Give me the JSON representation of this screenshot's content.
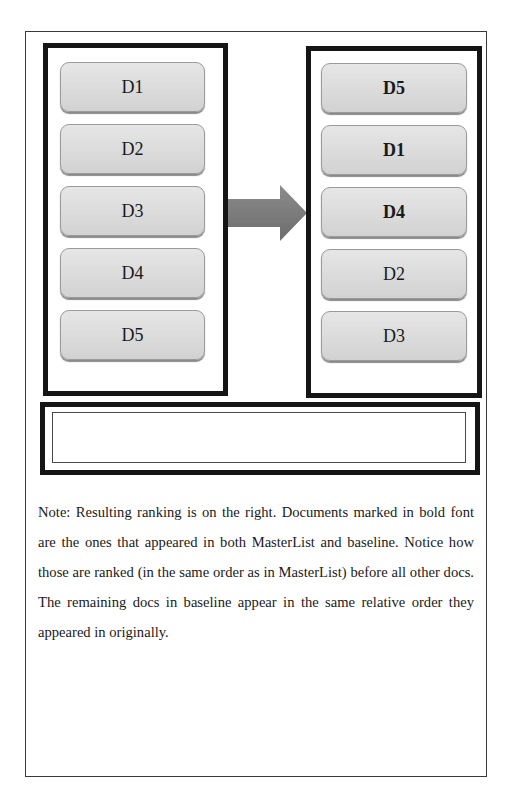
{
  "left_list": {
    "label": "baseline",
    "items": [
      {
        "label": "D1",
        "bold": false
      },
      {
        "label": "D2",
        "bold": false
      },
      {
        "label": "D3",
        "bold": false
      },
      {
        "label": "D4",
        "bold": false
      },
      {
        "label": "D5",
        "bold": false
      }
    ]
  },
  "right_list": {
    "label": "resulting ranking",
    "items": [
      {
        "label": "D5",
        "bold": true
      },
      {
        "label": "D1",
        "bold": true
      },
      {
        "label": "D4",
        "bold": true
      },
      {
        "label": "D2",
        "bold": false
      },
      {
        "label": "D3",
        "bold": false
      }
    ]
  },
  "arrow": {
    "icon": "right-arrow-icon",
    "color": "#7a7a7a"
  },
  "bottom_box": {
    "content": ""
  },
  "note": {
    "text": "Note: Resulting ranking is on the right. Documents marked in bold font are the ones that appeared in both MasterList and baseline. Notice how those are ranked (in the same order as in MasterList) before all other docs. The remaining docs in baseline appear in the same relative order they appeared in originally."
  },
  "colors": {
    "box_border": "#151515",
    "doc_fill_top": "#e6e6e6",
    "doc_fill_bottom": "#d2d2d2",
    "doc_border": "#9a9a9a",
    "arrow": "#7a7a7a"
  }
}
